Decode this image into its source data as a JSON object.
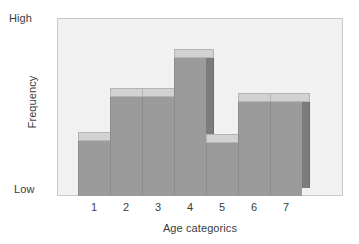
{
  "chart_data": {
    "type": "bar",
    "title": "",
    "subtitle": "",
    "xlabel": "Age categorics",
    "ylabel": "Frequency",
    "categories": [
      "1",
      "2",
      "3",
      "4",
      "5",
      "6",
      "7"
    ],
    "values": [
      33,
      59,
      59,
      82,
      32,
      56,
      56
    ],
    "ylim": [
      0,
      100
    ],
    "ytick_labels": [
      "Low",
      "High"
    ],
    "ytick_values": [
      0,
      100
    ],
    "grid": false,
    "legend": null,
    "annotations": [],
    "style": {
      "bar_fill": "#9b9b9b",
      "bar_top": "#d2d2d2",
      "bar_side": "#7c7c7c",
      "plot_background": "#f1f1f1",
      "frame_border": "#c9c9c9",
      "text_color": "#3c3c3c",
      "three_d": true
    }
  },
  "axes": {
    "y_high_label": "High",
    "y_low_label": "Low",
    "y_title": "Frequency",
    "x_title": "Age categorics"
  }
}
